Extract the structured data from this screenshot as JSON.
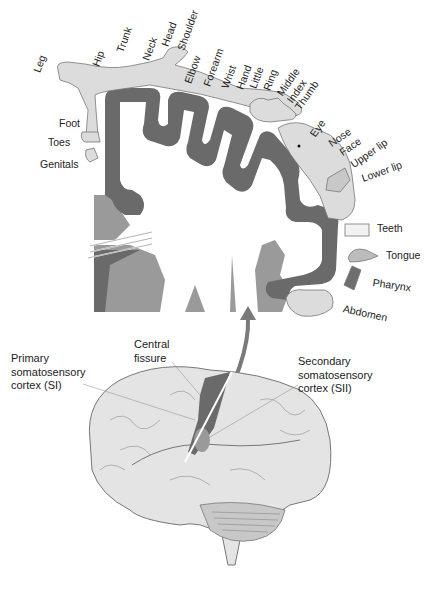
{
  "diagram": {
    "colors": {
      "cortex_dark": "#6a6a6a",
      "cortex_mid": "#9a9a9a",
      "body_fill": "#dcdcdc",
      "brain_fill": "#e4e4e4",
      "outline": "#555555"
    },
    "homunculus_labels": {
      "leg": "Leg",
      "hip": "Hip",
      "trunk": "Trunk",
      "neck": "Neck",
      "head": "Head",
      "shoulder": "Shoulder",
      "elbow": "Elbow",
      "forearm": "Forearm",
      "wrist": "Wrist",
      "hand": "Hand",
      "little": "Little",
      "ring": "Ring",
      "middle": "Middle",
      "index": "Index",
      "thumb": "Thumb",
      "eye": "Eye",
      "nose": "Nose",
      "face": "Face",
      "upper_lip": "Upper lip",
      "lower_lip": "Lower lip",
      "teeth": "Teeth",
      "tongue": "Tongue",
      "pharynx": "Pharynx",
      "abdomen": "Abdomen",
      "foot": "Foot",
      "toes": "Toes",
      "genitals": "Genitals"
    },
    "brain_labels": {
      "central_fissure": [
        "Central",
        "fissure"
      ],
      "primary": [
        "Primary",
        "somatosensory",
        "cortex (SI)"
      ],
      "secondary": [
        "Secondary",
        "somatosensory",
        "cortex (SII)"
      ]
    }
  }
}
